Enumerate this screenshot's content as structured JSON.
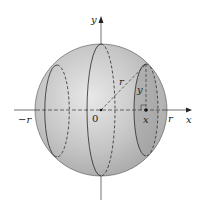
{
  "diagram": {
    "type": "sphere-cross-sections",
    "labels": {
      "y_axis": "y",
      "x_axis": "x",
      "neg_r": "−r",
      "origin": "0",
      "pos_r": "r",
      "radius": "r",
      "height": "y",
      "point_x": "x"
    },
    "colors": {
      "sphere_fill": "#c4c4c4",
      "sphere_highlight": "#e6e6e6",
      "slice_fill": "#a9a9a9",
      "line": "#2a2a2a"
    }
  }
}
